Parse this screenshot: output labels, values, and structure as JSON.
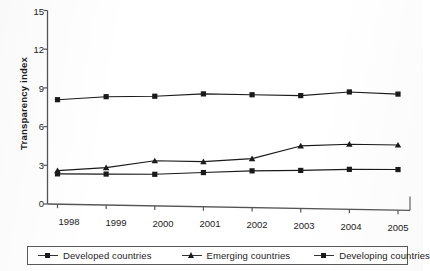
{
  "chart_data": {
    "type": "line",
    "title": "",
    "xlabel": "",
    "ylabel": "Transparency index",
    "categories": [
      "1998",
      "1999",
      "2000",
      "2001",
      "2002",
      "2003",
      "2004",
      "2005"
    ],
    "x": [
      1998,
      1999,
      2000,
      2001,
      2002,
      2003,
      2004,
      2005
    ],
    "ylim": [
      0,
      15
    ],
    "yticks": [
      0,
      3,
      6,
      9,
      12,
      15
    ],
    "grid": false,
    "legend_position": "bottom",
    "series": [
      {
        "name": "Developed countries",
        "marker": "square",
        "color": "#1a1a1a",
        "values": [
          8.1,
          8.4,
          8.5,
          8.75,
          8.75,
          8.75,
          9.1,
          9.0
        ]
      },
      {
        "name": "Emerging countries",
        "marker": "triangle",
        "color": "#1a1a1a",
        "values": [
          2.6,
          2.9,
          3.5,
          3.5,
          3.8,
          4.85,
          5.05,
          5.05
        ]
      },
      {
        "name": "Developing countries",
        "marker": "square",
        "color": "#1a1a1a",
        "values": [
          2.35,
          2.4,
          2.45,
          2.65,
          2.85,
          2.95,
          3.1,
          3.15
        ]
      }
    ]
  },
  "axis": {
    "y_title": "Transparency index",
    "y_tick_labels": [
      "15",
      "12",
      "9",
      "6",
      "3",
      "0"
    ],
    "x_tick_labels": [
      "1998",
      "1999",
      "2000",
      "2001",
      "2002",
      "2003",
      "2004",
      "2005"
    ]
  },
  "legend": {
    "items": [
      {
        "label": "Developed countries",
        "marker": "square-marker-icon"
      },
      {
        "label": "Emerging countries",
        "marker": "triangle-marker-icon"
      },
      {
        "label": "Developing countries",
        "marker": "square-marker-icon"
      }
    ]
  },
  "colors": {
    "line": "#333333",
    "marker": "#1a1a1a",
    "axis": "#555555",
    "text": "#1c1c1c",
    "background": "#ffffff"
  }
}
